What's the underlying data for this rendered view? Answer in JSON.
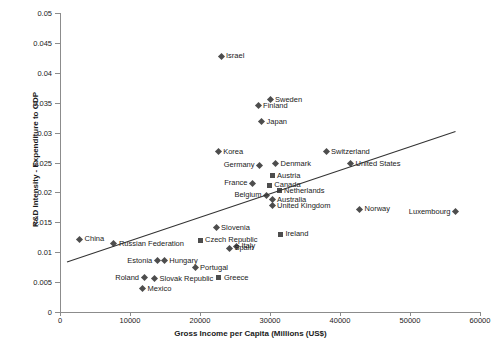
{
  "chart_data": {
    "type": "scatter",
    "title": "",
    "xlabel": "Gross Income per Capita (Millions (US$)",
    "ylabel": "R&D Intensity - Expenditure to GDP",
    "xlim": [
      0,
      60000
    ],
    "ylim": [
      0,
      0.05
    ],
    "grid": false,
    "legend": "none",
    "x_ticks": [
      "0",
      "10000",
      "20000",
      "30000",
      "40000",
      "50000",
      "60000"
    ],
    "x_tick_values": [
      0,
      10000,
      20000,
      30000,
      40000,
      50000,
      60000
    ],
    "y_ticks": [
      "0",
      "0.005",
      "0.01",
      "0.015",
      "0.02",
      "0.025",
      "0.03",
      "0.035",
      "0.04",
      "0.045",
      "0.05"
    ],
    "y_tick_values": [
      0,
      0.005,
      0.01,
      0.015,
      0.02,
      0.025,
      0.03,
      0.035,
      0.04,
      0.045,
      0.05
    ],
    "marker_color": "#4d4d4d",
    "trendline_color": "#333333",
    "trendline": {
      "x0": 1000,
      "y0": 0.00835,
      "x1": 56500,
      "y1": 0.0302
    },
    "points": [
      {
        "label": "Israel",
        "x": 23000,
        "y": 0.0428,
        "marker": "diamond",
        "label_side": "right"
      },
      {
        "label": "Sweden",
        "x": 30000,
        "y": 0.0355,
        "marker": "diamond",
        "label_side": "right"
      },
      {
        "label": "Finland",
        "x": 28300,
        "y": 0.0345,
        "marker": "diamond",
        "label_side": "right"
      },
      {
        "label": "Japan",
        "x": 28800,
        "y": 0.0318,
        "marker": "diamond",
        "label_side": "right"
      },
      {
        "label": "Switzerland",
        "x": 38000,
        "y": 0.0268,
        "marker": "diamond",
        "label_side": "right"
      },
      {
        "label": "Korea",
        "x": 22600,
        "y": 0.0268,
        "marker": "diamond",
        "label_side": "right"
      },
      {
        "label": "United States",
        "x": 41500,
        "y": 0.0248,
        "marker": "diamond",
        "label_side": "right"
      },
      {
        "label": "Denmark",
        "x": 30800,
        "y": 0.0248,
        "marker": "diamond",
        "label_side": "right"
      },
      {
        "label": "Germany",
        "x": 28500,
        "y": 0.0245,
        "marker": "diamond",
        "label_side": "left"
      },
      {
        "label": "Austria",
        "x": 30300,
        "y": 0.0228,
        "marker": "square",
        "label_side": "right"
      },
      {
        "label": "France",
        "x": 27500,
        "y": 0.0215,
        "marker": "diamond",
        "label_side": "left"
      },
      {
        "label": "Canada",
        "x": 29900,
        "y": 0.0212,
        "marker": "square",
        "label_side": "right"
      },
      {
        "label": "Netherlands",
        "x": 31300,
        "y": 0.0203,
        "marker": "square",
        "label_side": "right"
      },
      {
        "label": "Belgium",
        "x": 29500,
        "y": 0.0195,
        "marker": "diamond",
        "label_side": "left"
      },
      {
        "label": "Australia",
        "x": 30300,
        "y": 0.0188,
        "marker": "diamond",
        "label_side": "right"
      },
      {
        "label": "United Kingdom",
        "x": 30300,
        "y": 0.0178,
        "marker": "diamond",
        "label_side": "right"
      },
      {
        "label": "Norway",
        "x": 42800,
        "y": 0.0172,
        "marker": "diamond",
        "label_side": "right"
      },
      {
        "label": "Luxembourg",
        "x": 56500,
        "y": 0.0168,
        "marker": "diamond",
        "label_side": "left"
      },
      {
        "label": "Slovenia",
        "x": 22300,
        "y": 0.0141,
        "marker": "diamond",
        "label_side": "right"
      },
      {
        "label": "Ireland",
        "x": 31500,
        "y": 0.013,
        "marker": "square",
        "label_side": "right"
      },
      {
        "label": "China",
        "x": 2800,
        "y": 0.0122,
        "marker": "diamond",
        "label_side": "right"
      },
      {
        "label": "Czech Republic",
        "x": 20000,
        "y": 0.012,
        "marker": "square",
        "label_side": "right"
      },
      {
        "label": "Russian Federation",
        "x": 7700,
        "y": 0.0114,
        "marker": "diamond",
        "label_side": "right"
      },
      {
        "label": "Italy",
        "x": 25200,
        "y": 0.011,
        "marker": "diamond",
        "label_side": "right"
      },
      {
        "label": "Spain",
        "x": 24200,
        "y": 0.0107,
        "marker": "diamond",
        "label_side": "right"
      },
      {
        "label": "Hungary",
        "x": 14900,
        "y": 0.0086,
        "marker": "diamond",
        "label_side": "right"
      },
      {
        "label": "Estonia",
        "x": 13900,
        "y": 0.0086,
        "marker": "diamond",
        "label_side": "left"
      },
      {
        "label": "Portugal",
        "x": 19300,
        "y": 0.0074,
        "marker": "diamond",
        "label_side": "right"
      },
      {
        "label": "Greece",
        "x": 22700,
        "y": 0.0057,
        "marker": "square",
        "label_side": "right"
      },
      {
        "label": "Slovak Republic",
        "x": 13500,
        "y": 0.0056,
        "marker": "diamond",
        "label_side": "right"
      },
      {
        "label": "Roland",
        "x": 12000,
        "y": 0.0057,
        "marker": "diamond",
        "label_side": "left"
      },
      {
        "label": "Mexico",
        "x": 11800,
        "y": 0.0039,
        "marker": "diamond",
        "label_side": "right"
      }
    ]
  }
}
